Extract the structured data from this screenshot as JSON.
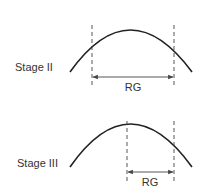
{
  "panels": [
    {
      "id": "stage-ii",
      "stage_label": "Stage II",
      "measure_label": "RG"
    },
    {
      "id": "stage-iii",
      "stage_label": "Stage III",
      "measure_label": "RG"
    }
  ]
}
